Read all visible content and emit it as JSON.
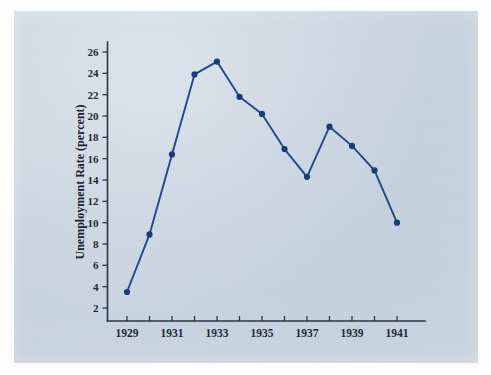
{
  "figure": {
    "background_color": "#c9d4e0",
    "page_border_color": "#fdfdfd",
    "axis_color": "#2b3642",
    "series_color": "#23478c",
    "point_color": "#1b3a7a"
  },
  "chart_data": {
    "type": "line",
    "title": "",
    "xlabel": "",
    "ylabel": "Unemployment Rate (percent)",
    "x": [
      1929,
      1930,
      1931,
      1932,
      1933,
      1934,
      1935,
      1936,
      1937,
      1938,
      1939,
      1940,
      1941
    ],
    "values": [
      3.5,
      8.9,
      16.4,
      23.9,
      25.1,
      21.8,
      20.2,
      16.9,
      14.3,
      19.0,
      17.2,
      14.9,
      10.0
    ],
    "series": [
      {
        "name": "Unemployment Rate",
        "values": [
          3.5,
          8.9,
          16.4,
          23.9,
          25.1,
          21.8,
          20.2,
          16.9,
          14.3,
          19.0,
          17.2,
          14.9,
          10.0
        ]
      }
    ],
    "xlim": [
      1928.5,
      1942.0
    ],
    "ylim": [
      0,
      27.5
    ],
    "y_ticks": [
      2,
      4,
      6,
      8,
      10,
      12,
      14,
      16,
      18,
      20,
      22,
      24,
      26
    ],
    "y_tick_labels": [
      "2",
      "4",
      "6",
      "8",
      "10",
      "12",
      "14",
      "16",
      "18",
      "20",
      "22",
      "24",
      "26"
    ],
    "x_ticks": [
      1929,
      1930,
      1931,
      1932,
      1933,
      1934,
      1935,
      1936,
      1937,
      1938,
      1939,
      1940,
      1941
    ],
    "x_tick_labels": [
      "1929",
      "",
      "1931",
      "",
      "1933",
      "",
      "1935",
      "",
      "1937",
      "",
      "1939",
      "",
      "1941"
    ],
    "x_labeled_ticks": [
      "1929",
      "1931",
      "1933",
      "1935",
      "1937",
      "1939",
      "1941"
    ],
    "grid": false,
    "legend": false,
    "legend_position": "none",
    "markers": "filled-circle"
  }
}
